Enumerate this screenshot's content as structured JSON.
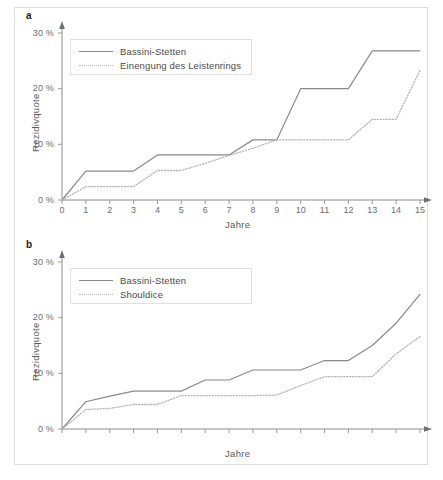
{
  "figure": {
    "background": "#ffffff",
    "border_color": "#dcdcdc",
    "solid_color": "#8a8a8a",
    "dotted_color": "#b4b4b4"
  },
  "panels": [
    {
      "label": "a",
      "legend": [
        "Bassini-Stetten",
        "Einengung des Leistenrings"
      ]
    },
    {
      "label": "b",
      "legend": [
        "Bassini-Stetten",
        "Shouldice"
      ]
    }
  ],
  "chart_data": [
    {
      "type": "line",
      "panel": "a",
      "title": "",
      "xlabel": "Jahre",
      "ylabel": "Rezidivquote",
      "xlim": [
        0,
        15
      ],
      "ylim": [
        0,
        30
      ],
      "xticks": [
        "0",
        "1",
        "2",
        "3",
        "4",
        "5",
        "6",
        "7",
        "8",
        "9",
        "10",
        "11",
        "12",
        "13",
        "14",
        "15"
      ],
      "yticks": [
        "0 %",
        "10 %",
        "20 %",
        "30 %"
      ],
      "ytick_values": [
        0,
        10,
        20,
        30
      ],
      "grid": false,
      "legend_position": "top-left",
      "x": [
        0,
        1,
        2,
        3,
        4,
        5,
        6,
        7,
        8,
        9,
        10,
        11,
        12,
        13,
        14,
        15
      ],
      "series": [
        {
          "name": "Bassini-Stetten",
          "style": "solid",
          "color": "#8a8a8a",
          "values": [
            0,
            5.2,
            5.2,
            5.2,
            8.1,
            8.1,
            8.1,
            8.1,
            10.8,
            10.8,
            20.0,
            20.0,
            20.0,
            26.8,
            26.8,
            26.8
          ]
        },
        {
          "name": "Einengung des Leistenrings",
          "style": "dotted",
          "color": "#b4b4b4",
          "values": [
            0,
            2.4,
            2.4,
            2.4,
            5.3,
            5.3,
            6.6,
            8.0,
            9.3,
            10.8,
            10.8,
            10.8,
            10.8,
            14.5,
            14.5,
            23.3
          ]
        }
      ]
    },
    {
      "type": "line",
      "panel": "b",
      "title": "",
      "xlabel": "Jahre",
      "ylabel": "Rezidivquote",
      "xlim": [
        0,
        15
      ],
      "ylim": [
        0,
        30
      ],
      "xticks": [
        "0",
        "1",
        "2",
        "3",
        "4",
        "5",
        "6",
        "7",
        "8",
        "9",
        "10",
        "11",
        "12",
        "13",
        "14",
        "15"
      ],
      "yticks": [
        "0 %",
        "10 %",
        "20 %",
        "30 %"
      ],
      "ytick_values": [
        0,
        10,
        20,
        30
      ],
      "grid": false,
      "legend_position": "top-left",
      "x": [
        0,
        1,
        2,
        3,
        4,
        5,
        6,
        7,
        8,
        9,
        10,
        11,
        12,
        13,
        14,
        15
      ],
      "series": [
        {
          "name": "Bassini-Stetten",
          "style": "solid",
          "color": "#8a8a8a",
          "values": [
            0,
            4.9,
            5.9,
            6.8,
            6.8,
            6.8,
            8.8,
            8.8,
            10.6,
            10.6,
            10.6,
            12.3,
            12.3,
            15.0,
            19.0,
            24.2
          ]
        },
        {
          "name": "Shouldice",
          "style": "dotted",
          "color": "#b4b4b4",
          "values": [
            0,
            3.5,
            3.7,
            4.4,
            4.4,
            6.0,
            6.0,
            6.0,
            6.0,
            6.1,
            7.8,
            9.4,
            9.4,
            9.4,
            13.5,
            16.6
          ]
        }
      ]
    }
  ]
}
